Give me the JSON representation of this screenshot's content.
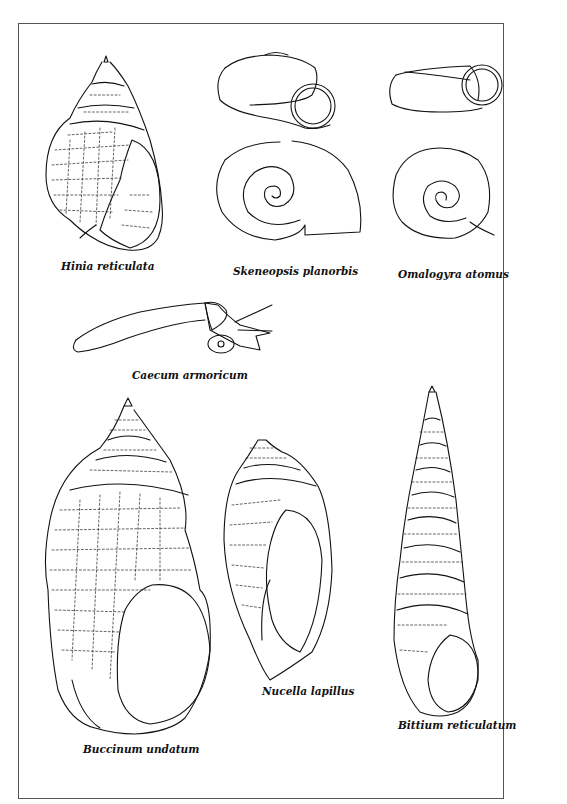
{
  "plate": {
    "border_color": "#555555",
    "specimens": [
      {
        "id": "hinia",
        "label": "Hinia reticulata"
      },
      {
        "id": "skeneopsis",
        "label": "Skeneopsis planorbis"
      },
      {
        "id": "omalogyra",
        "label": "Omalogyra atomus"
      },
      {
        "id": "caecum",
        "label": "Caecum armoricum"
      },
      {
        "id": "buccinum",
        "label": "Buccinum undatum"
      },
      {
        "id": "nucella",
        "label": "Nucella lapillus"
      },
      {
        "id": "bittium",
        "label": "Bittium reticulatum"
      }
    ]
  }
}
